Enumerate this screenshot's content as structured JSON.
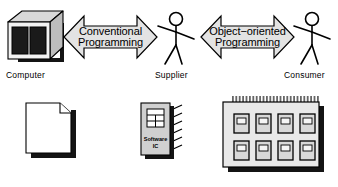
{
  "diagram": {
    "colors": {
      "ink": "#000000",
      "paper": "#ffffff",
      "arrow_fill": "#e3e3e3",
      "box_top": "#d8d8d8",
      "box_side": "#bdbdbd",
      "box_front": "#f2f2f2",
      "screen_dark": "#1a1a1a",
      "shadow": "#141414",
      "board_fill": "#e8e8e8",
      "chip_fill": "#d0d0d0"
    },
    "top_row": {
      "computer": {
        "label": "Computer",
        "icon": "computer-box-icon",
        "panels": 2
      },
      "arrow_left": {
        "line1": "Conventional",
        "line2": "Programming",
        "icon": "double-headed-arrow-icon",
        "direction": "bidirectional"
      },
      "supplier": {
        "label": "Supplier",
        "icon": "stick-figure-icon"
      },
      "arrow_right": {
        "line1": "Object−oriented",
        "line2": "Programming",
        "icon": "double-headed-arrow-icon",
        "direction": "bidirectional"
      },
      "consumer": {
        "label": "Consumer",
        "icon": "stick-figure-icon"
      }
    },
    "bottom_row": {
      "document": {
        "icon": "page-document-icon",
        "label": ""
      },
      "software_ic": {
        "icon": "chip-icon",
        "line1": "Software",
        "line2": "IC",
        "pins": 6,
        "grid_rows": 3,
        "grid_cols": 2
      },
      "board": {
        "icon": "circuit-board-icon",
        "chip_rows": 2,
        "chip_cols": 4,
        "chip_count": 8,
        "connector_pins": 28
      }
    }
  }
}
